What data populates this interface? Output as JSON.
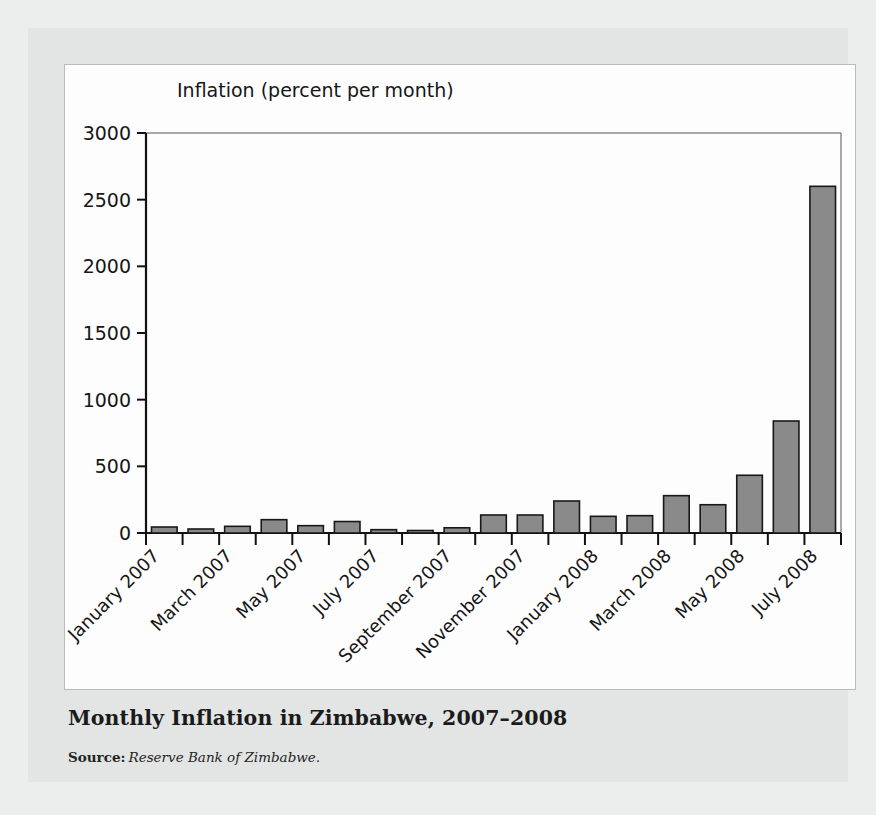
{
  "figure": {
    "title": "Monthly Inflation in Zimbabwe, 2007–2008",
    "source_label": "Source:",
    "source_text": "Reserve Bank of Zimbabwe."
  },
  "colors": {
    "page_background": "#eceded",
    "panel_background": "#e3e4e4",
    "chart_background": "#fdfdfd",
    "bar_fill": "#8a8a8a",
    "bar_stroke": "#181818",
    "axis": "#111111",
    "text": "#161616"
  },
  "chart_data": {
    "type": "bar",
    "title": "Monthly Inflation in Zimbabwe, 2007–2008",
    "xlabel": "",
    "ylabel": "Inflation (percent per month)",
    "ylim": [
      0,
      3000
    ],
    "yticks": [
      0,
      500,
      1000,
      1500,
      2000,
      2500,
      3000
    ],
    "ytick_labels": [
      "0",
      "500",
      "1000",
      "1500",
      "2000",
      "2500",
      "3000"
    ],
    "grid": false,
    "legend": "none",
    "xtick_rotation": 45,
    "xtick_labels_shown": [
      "January 2007",
      "March 2007",
      "May 2007",
      "July 2007",
      "September 2007",
      "November 2007",
      "January 2008",
      "March 2008",
      "May 2008",
      "July 2008"
    ],
    "categories": [
      "January 2007",
      "February 2007",
      "March 2007",
      "April 2007",
      "May 2007",
      "June 2007",
      "July 2007",
      "August 2007",
      "September 2007",
      "October 2007",
      "November 2007",
      "December 2007",
      "January 2008",
      "February 2008",
      "March 2008",
      "April 2008",
      "May 2008",
      "June 2008",
      "July 2008"
    ],
    "values": [
      45,
      30,
      50,
      100,
      55,
      86,
      25,
      12,
      39,
      135,
      135,
      240,
      125,
      130,
      280,
      212,
      433,
      840,
      2600
    ]
  }
}
